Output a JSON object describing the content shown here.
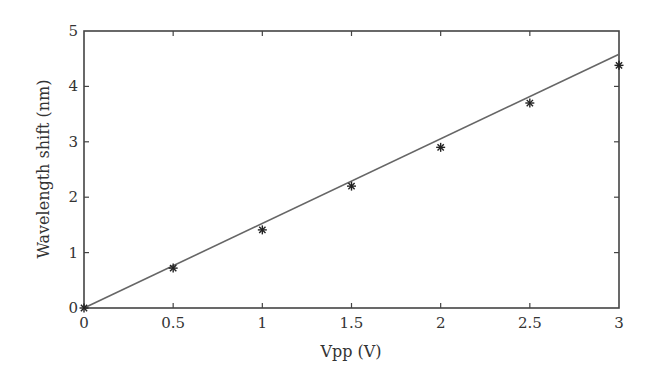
{
  "chart_data": {
    "type": "scatter",
    "title": "",
    "xlabel": "Vpp (V)",
    "ylabel": "Wavelength shift (nm)",
    "xlim": [
      0,
      3
    ],
    "ylim": [
      0,
      5
    ],
    "x_ticks": [
      0,
      0.5,
      1,
      1.5,
      2,
      2.5,
      3
    ],
    "x_tick_labels": [
      "0",
      "0.5",
      "1",
      "1.5",
      "2",
      "2.5",
      "3"
    ],
    "y_ticks": [
      0,
      1,
      2,
      3,
      4,
      5
    ],
    "y_tick_labels": [
      "0",
      "1",
      "2",
      "3",
      "4",
      "5"
    ],
    "grid": false,
    "legend": null,
    "series": [
      {
        "name": "Measured",
        "style": "asterisk markers",
        "color": "#222222",
        "x": [
          0,
          0.5,
          1.0,
          1.5,
          2.0,
          2.5,
          3.0
        ],
        "y": [
          0,
          0.72,
          1.41,
          2.2,
          2.9,
          3.7,
          4.38
        ]
      },
      {
        "name": "Linear fit",
        "style": "solid line",
        "color": "#666666",
        "x": [
          0,
          3
        ],
        "y": [
          0,
          4.58
        ]
      }
    ]
  }
}
